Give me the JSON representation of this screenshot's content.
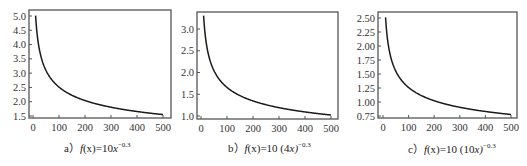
{
  "chart_data": [
    {
      "type": "line",
      "id": "a",
      "title": "a）f(x)=10x^-0.3",
      "caption": {
        "prefix": "a）",
        "func": "f",
        "arg": "(x)",
        "eq": "=10",
        "base": "x",
        "exp": "−0.3"
      },
      "xlabel": "",
      "ylabel": "",
      "xlim": [
        0,
        500
      ],
      "ylim": [
        1.45,
        5.1
      ],
      "xticks": [
        0,
        100,
        200,
        300,
        400,
        500
      ],
      "yticks": [
        "1.5",
        "2.0",
        "2.5",
        "3.0",
        "3.5",
        "4.0",
        "4.5",
        "5.0"
      ],
      "formula": {
        "coef": 10,
        "scale": 1,
        "power": -0.3
      },
      "x": [
        10,
        20,
        30,
        50,
        75,
        100,
        150,
        200,
        250,
        300,
        400,
        500
      ],
      "values": [
        5.01,
        4.07,
        3.6,
        3.09,
        2.74,
        2.51,
        2.22,
        2.04,
        1.91,
        1.81,
        1.66,
        1.55
      ],
      "grid": false
    },
    {
      "type": "line",
      "id": "b",
      "title": "b）f(x)=10(4x)^-0.3",
      "caption": {
        "prefix": "b）",
        "func": "f",
        "arg": "(x)",
        "eq": "=10 (4",
        "base": "x)",
        "exp": "−0.3"
      },
      "xlabel": "",
      "ylabel": "",
      "xlim": [
        0,
        500
      ],
      "ylim": [
        0.95,
        3.4
      ],
      "xticks": [
        0,
        100,
        200,
        300,
        400,
        500
      ],
      "yticks": [
        "1.0",
        "1.5",
        "2.0",
        "2.5",
        "3.0"
      ],
      "formula": {
        "coef": 10,
        "scale": 4,
        "power": -0.3
      },
      "x": [
        10,
        20,
        30,
        50,
        75,
        100,
        150,
        200,
        250,
        300,
        400,
        500
      ],
      "values": [
        3.3,
        2.68,
        2.37,
        2.03,
        1.8,
        1.66,
        1.46,
        1.34,
        1.26,
        1.19,
        1.09,
        1.02
      ],
      "grid": false
    },
    {
      "type": "line",
      "id": "c",
      "title": "c）f(x)=10(10x)^-0.3",
      "caption": {
        "prefix": "c）",
        "func": "f",
        "arg": "(x)",
        "eq": "=10 (10",
        "base": "x)",
        "exp": "−0.3"
      },
      "xlabel": "",
      "ylabel": "",
      "xlim": [
        0,
        500
      ],
      "ylim": [
        0.72,
        2.58
      ],
      "xticks": [
        0,
        100,
        200,
        300,
        400,
        500
      ],
      "yticks": [
        "0.75",
        "1.00",
        "1.25",
        "1.50",
        "1.75",
        "2.00",
        "2.25",
        "2.50"
      ],
      "formula": {
        "coef": 10,
        "scale": 10,
        "power": -0.3
      },
      "x": [
        10,
        20,
        30,
        50,
        75,
        100,
        150,
        200,
        250,
        300,
        400,
        500
      ],
      "values": [
        2.51,
        2.04,
        1.81,
        1.55,
        1.37,
        1.26,
        1.11,
        1.02,
        0.96,
        0.9,
        0.83,
        0.77
      ],
      "grid": false
    }
  ],
  "style": {
    "line_color": "#1a1a1a",
    "frame_color": "#555555",
    "background": "#ffffff"
  }
}
